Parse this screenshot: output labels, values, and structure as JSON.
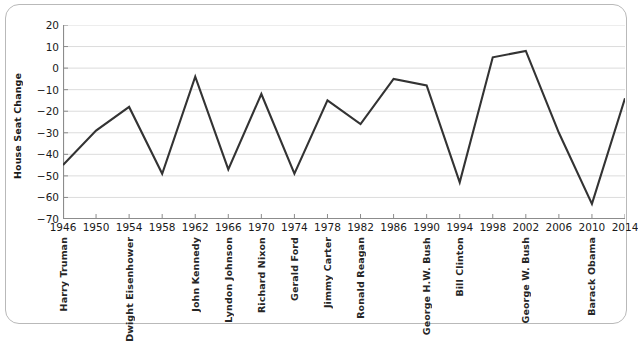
{
  "chart_data": {
    "type": "line",
    "title": "",
    "xlabel": "",
    "ylabel": "House Seat Change",
    "xlim": [
      1946,
      2014
    ],
    "ylim": [
      -70,
      20
    ],
    "grid": true,
    "legend": "none",
    "line_color": "#333333",
    "gridline_color": "#dcdcdc",
    "axis_color": "#808080",
    "x": [
      1946,
      1950,
      1954,
      1958,
      1962,
      1966,
      1970,
      1974,
      1978,
      1982,
      1986,
      1990,
      1994,
      1998,
      2002,
      2006,
      2010,
      2014
    ],
    "values": [
      -45,
      -29,
      -18,
      -49,
      -4,
      -47,
      -12,
      -49,
      -15,
      -26,
      -5,
      -8,
      -53,
      5,
      8,
      -30,
      -63,
      -14
    ],
    "x_tick_labels": [
      "1946",
      "1950",
      "1954",
      "1958",
      "1962",
      "1966",
      "1970",
      "1974",
      "1978",
      "1982",
      "1986",
      "1990",
      "1994",
      "1998",
      "2002",
      "2006",
      "2010",
      "2014"
    ],
    "y_tick_labels": [
      "20",
      "10",
      "0",
      "−10",
      "−20",
      "−30",
      "−40",
      "−50",
      "−60",
      "−70"
    ],
    "y_ticks": [
      20,
      10,
      0,
      -10,
      -20,
      -30,
      -40,
      -50,
      -60,
      -70
    ],
    "annotations": [
      {
        "label": "Harry Truman",
        "year": 1946
      },
      {
        "label": "Dwight Eisenhower",
        "year": 1954
      },
      {
        "label": "John Kennedy",
        "year": 1962
      },
      {
        "label": "Lyndon Johnson",
        "year": 1966
      },
      {
        "label": "Richard Nixon",
        "year": 1970
      },
      {
        "label": "Gerald Ford",
        "year": 1974
      },
      {
        "label": "Jimmy Carter",
        "year": 1978
      },
      {
        "label": "Ronald Reagan",
        "year": 1982
      },
      {
        "label": "George H.W. Bush",
        "year": 1990
      },
      {
        "label": "Bill Clinton",
        "year": 1994
      },
      {
        "label": "George W. Bush",
        "year": 2002
      },
      {
        "label": "Barack Obama",
        "year": 2010
      }
    ]
  }
}
